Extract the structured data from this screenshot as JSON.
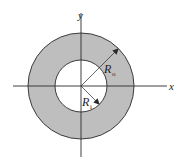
{
  "diagram": {
    "type": "annulus cross-section",
    "colors": {
      "fill": "#bebebe",
      "stroke": "#2a2a2a",
      "background": "#ffffff"
    },
    "axes": {
      "x_label": "x",
      "y_label": "y"
    },
    "outer_radius": {
      "symbol": "R",
      "subscript": "o"
    },
    "inner_radius": {
      "symbol": "R",
      "subscript": "i"
    }
  }
}
